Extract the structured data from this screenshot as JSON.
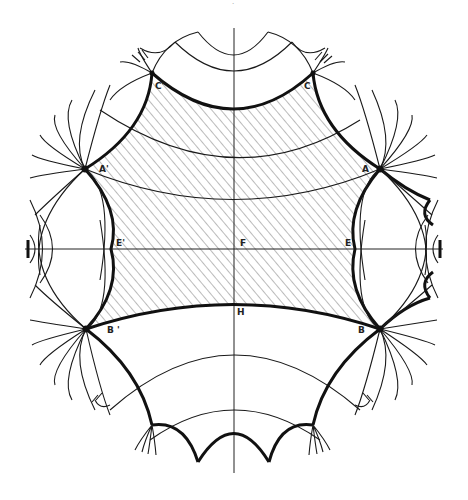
{
  "figure": {
    "type": "hyperbolic tessellation (Poincaré disk) with shaded fundamental region",
    "page_mark": "·",
    "colors": {
      "ink": "#111111",
      "paper": "#ffffff",
      "hatch": "#555555"
    },
    "labels": {
      "A": "A",
      "A_prime": "A'",
      "B": "B",
      "B_prime": "B '",
      "C": "C",
      "C_prime": "C'",
      "E": "E",
      "E_prime": "E'",
      "F": "F",
      "H": "H"
    }
  }
}
